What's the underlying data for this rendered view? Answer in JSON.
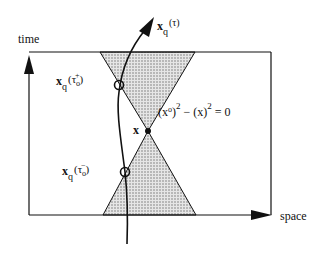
{
  "diagram": {
    "axes": {
      "vertical_label": "time",
      "horizontal_label": "space"
    },
    "worldline_label": {
      "base": "x",
      "sub": "q",
      "arg": "(τ)"
    },
    "upper_point_label": {
      "base": "x",
      "sub": "q",
      "arg_open": "(τ",
      "arg_sub": "o",
      "arg_sup": "+",
      "arg_close": ")"
    },
    "lower_point_label": {
      "base": "x",
      "sub": "q",
      "arg_open": "(τ",
      "arg_sub": "o",
      "arg_sup": "−",
      "arg_close": ")"
    },
    "apex_label": "x",
    "cone_equation": {
      "p1": "(x",
      "p1_sup": "o",
      "p2": ")",
      "sq1": "2",
      "p3": " − (x)",
      "sq2": "2",
      "p4": " = 0"
    },
    "colors": {
      "line": "#111111",
      "cone_fill": "#bdbdbd",
      "background": "#ffffff"
    }
  }
}
